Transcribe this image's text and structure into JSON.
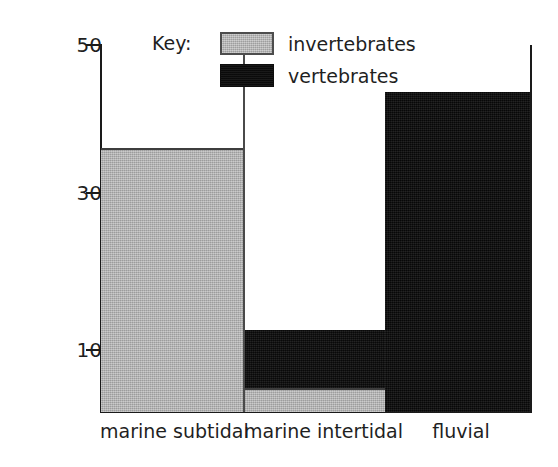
{
  "chart_data": {
    "type": "bar",
    "subtype": "stacked-bar",
    "title": "",
    "xlabel": "",
    "ylabel": "rock volume, %",
    "categories": [
      "marine subtidal",
      "marine intertidal",
      "fluvial"
    ],
    "series": [
      {
        "name": "invertebrates",
        "color": "#b3b3b3",
        "values": [
          36.5,
          5.2,
          0
        ]
      },
      {
        "name": "vertebrates",
        "color": "#0d0d0d",
        "values": [
          0,
          7.5,
          43.8
        ]
      }
    ],
    "totals": [
      36.5,
      12.7,
      43.8
    ],
    "ylim": [
      2,
      50
    ],
    "yticks": [
      10,
      30,
      50
    ],
    "ytick_labels": [
      "10",
      "30",
      "50"
    ],
    "grid": false,
    "legend_position": "top-center",
    "legend_title": "Key:",
    "legend_entries": [
      {
        "label": "invertebrates",
        "color": "#b3b3b3"
      },
      {
        "label": "vertebrates",
        "color": "#0d0d0d"
      }
    ]
  },
  "axis": {
    "y_title": "rock volume, %",
    "ticks": [
      {
        "label": "50",
        "value": 50
      },
      {
        "label": "30",
        "value": 30
      },
      {
        "label": "10",
        "value": 10
      }
    ]
  },
  "legend": {
    "title": "Key:",
    "items": [
      {
        "label": "invertebrates"
      },
      {
        "label": "vertebrates"
      }
    ]
  },
  "bars": [
    {
      "category": "marine subtidal"
    },
    {
      "category": "marine intertidal"
    },
    {
      "category": "fluvial"
    }
  ]
}
